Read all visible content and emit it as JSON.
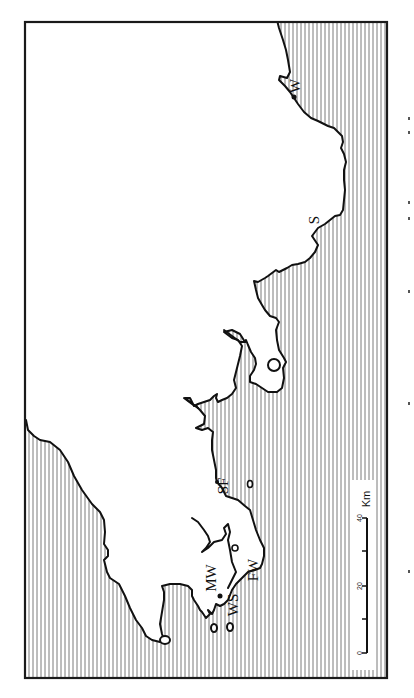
{
  "map": {
    "orientation": "rotated 90 degrees clockwise (north to the right)",
    "land_fill": "#ffffff",
    "sea_fill": "vertical hatching",
    "line_color": "#111111",
    "labels": [
      {
        "id": "W",
        "text": "W"
      },
      {
        "id": "S",
        "text": "S"
      },
      {
        "id": "O",
        "text": "O"
      },
      {
        "id": "SF",
        "text": "SF"
      },
      {
        "id": "MW",
        "text": "MW"
      },
      {
        "id": "WS",
        "text": "WS"
      },
      {
        "id": "FW",
        "text": "FW"
      }
    ],
    "scale_bar": {
      "ticks": [
        "0",
        "20",
        "40"
      ],
      "minor_ticks": [
        "10",
        "30"
      ],
      "unit": "Km"
    }
  }
}
